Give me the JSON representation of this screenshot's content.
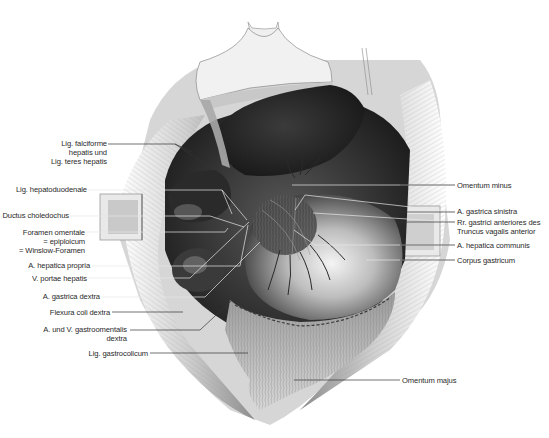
{
  "figure": {
    "colors": {
      "background": "#ffffff",
      "label_text": "#2a2a2a",
      "leader_dark": "#333333",
      "leader_light": "#e8e8e8",
      "organ_dark": "#1a1a1a",
      "organ_mid": "#6a6a6a",
      "organ_light": "#d9d9d9"
    }
  },
  "labels_left": [
    {
      "id": "lig-falciforme",
      "lines": [
        "Lig. falciforme",
        "hepatis und",
        "Lig. teres hepatis"
      ]
    },
    {
      "id": "lig-hepatoduodenale",
      "lines": [
        "Lig. hepatoduodenale"
      ]
    },
    {
      "id": "ductus-choledochus",
      "lines": [
        "Ductus choledochus"
      ]
    },
    {
      "id": "foramen-omentale",
      "lines": [
        "Foramen omentale",
        "= epiploicum",
        "= Winslow-Foramen"
      ]
    },
    {
      "id": "a-hepatica-propria",
      "lines": [
        "A. hepatica propria"
      ]
    },
    {
      "id": "v-portae-hepatis",
      "lines": [
        "V. portae hepatis"
      ]
    },
    {
      "id": "a-gastrica-dextra",
      "lines": [
        "A. gastrica dextra"
      ]
    },
    {
      "id": "flexura-coli-dextra",
      "lines": [
        "Flexura coli dextra"
      ]
    },
    {
      "id": "a-v-gastroomentalis-dextra",
      "lines": [
        "A. und V. gastroomentalis",
        "dextra"
      ]
    },
    {
      "id": "lig-gastrocolicum",
      "lines": [
        "Lig. gastrocolicum"
      ]
    }
  ],
  "labels_right": [
    {
      "id": "omentum-minus",
      "lines": [
        "Omentum minus"
      ]
    },
    {
      "id": "a-gastrica-sinistra",
      "lines": [
        "A. gastrica sinistra"
      ]
    },
    {
      "id": "rr-gastrici-anteriores",
      "lines": [
        "Rr. gastrici anteriores des",
        "Truncus vagalis anterior"
      ]
    },
    {
      "id": "a-hepatica-communis",
      "lines": [
        "A. hepatica communis"
      ]
    },
    {
      "id": "corpus-gastricum",
      "lines": [
        "Corpus gastricum"
      ]
    },
    {
      "id": "omentum-majus",
      "lines": [
        "Omentum majus"
      ]
    }
  ]
}
